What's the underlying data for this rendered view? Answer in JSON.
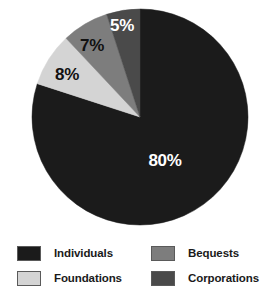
{
  "chart_data": {
    "type": "pie",
    "title": "",
    "subtitle": "",
    "xlabel": "",
    "ylabel": "",
    "grid": false,
    "legend_position": "bottom",
    "start_angle_deg": 0,
    "direction": "clockwise",
    "categories": [
      "Individuals",
      "Foundations",
      "Bequests",
      "Corporations"
    ],
    "values": [
      80,
      8,
      7,
      5
    ],
    "value_labels": [
      "80%",
      "8%",
      "7%",
      "5%"
    ],
    "colors": [
      "#1b1b1b",
      "#d4d4d4",
      "#7d7d7d",
      "#4a4a4a"
    ],
    "slices": [
      {
        "name": "Individuals",
        "value": 80,
        "label": "80%",
        "color": "#1b1b1b",
        "label_color": "#ffffff",
        "label_x": 165,
        "label_y": 162
      },
      {
        "name": "Foundations",
        "value": 8,
        "label": "8%",
        "color": "#d4d4d4",
        "label_color": "#111111",
        "label_x": 67,
        "label_y": 76
      },
      {
        "name": "Bequests",
        "value": 7,
        "label": "7%",
        "color": "#7d7d7d",
        "label_color": "#111111",
        "label_x": 92,
        "label_y": 47
      },
      {
        "name": "Corporations",
        "value": 5,
        "label": "5%",
        "color": "#4a4a4a",
        "label_color": "#ffffff",
        "label_x": 122,
        "label_y": 27
      }
    ]
  },
  "pie": {
    "center_x": 140,
    "center_y": 117,
    "radius": 108
  },
  "legend": {
    "entries": [
      {
        "label": "Individuals",
        "color": "#1b1b1b"
      },
      {
        "label": "Foundations",
        "color": "#d4d4d4"
      },
      {
        "label": "Bequests",
        "color": "#7d7d7d"
      },
      {
        "label": "Corporations",
        "color": "#4a4a4a"
      }
    ]
  }
}
